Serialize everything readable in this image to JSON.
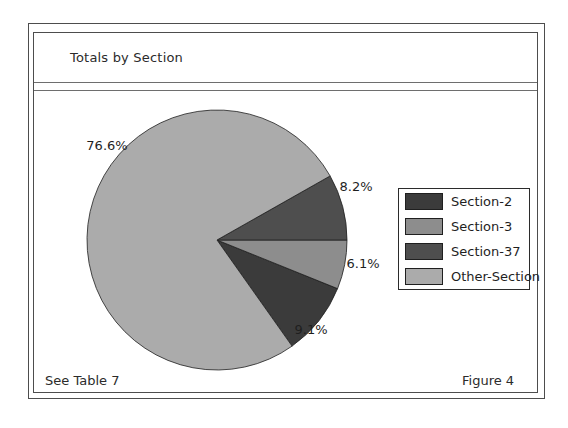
{
  "figure": {
    "title": "Totals by Section",
    "footnote": "See Table 7",
    "caption": "Figure 4"
  },
  "chart_data": {
    "type": "pie",
    "title": "Totals by Section",
    "legend_position": "right",
    "direction": "ccw",
    "start_angle_deg": 0,
    "outline_color": "#1f1f1f",
    "slices": [
      {
        "label": "Section-2",
        "value": 9.1,
        "pct_label": "9.1%",
        "color": "#3b3b3b",
        "start_deg": 305.28,
        "end_deg": 338.04
      },
      {
        "label": "Section-3",
        "value": 6.1,
        "pct_label": "6.1%",
        "color": "#8d8d8d",
        "start_deg": 338.04,
        "end_deg": 360.0
      },
      {
        "label": "Section-37",
        "value": 8.2,
        "pct_label": "8.2%",
        "color": "#4e4e4e",
        "start_deg": 0.0,
        "end_deg": 29.52
      },
      {
        "label": "Other-Section",
        "value": 76.6,
        "pct_label": "76.6%",
        "color": "#ababab",
        "start_deg": 29.52,
        "end_deg": 305.28
      }
    ],
    "legend_labels": [
      "Section-2",
      "Section-3",
      "Section-37",
      "Other-Section"
    ],
    "pie_layout": {
      "cx": 217,
      "cy": 240,
      "r": 130
    }
  }
}
